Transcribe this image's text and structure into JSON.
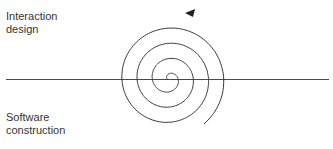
{
  "labels": {
    "top": [
      "Interaction",
      "design"
    ],
    "bottom": [
      "Software",
      "construction"
    ]
  },
  "diagram": {
    "type": "spiral",
    "center": [
      169,
      79
    ],
    "divider_y": 79,
    "arrow_direction": "counter-clockwise",
    "stroke_color": "#3a3a3a"
  }
}
